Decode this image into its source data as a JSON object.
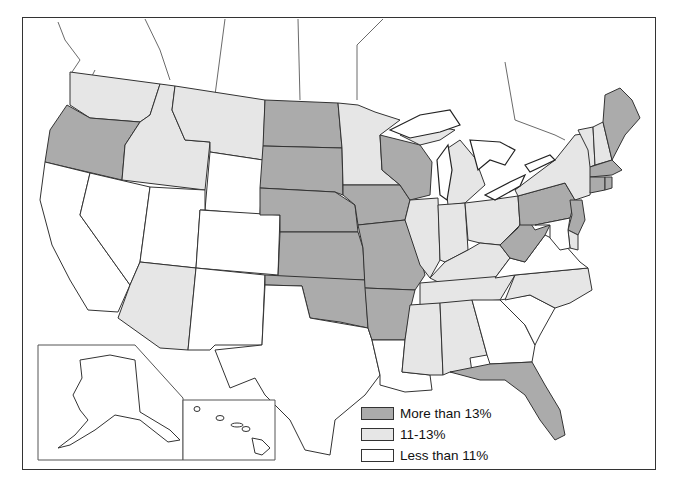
{
  "map": {
    "type": "choropleth",
    "region": "United States",
    "colors": {
      "high": "#ababab",
      "mid": "#e6e6e6",
      "low": "#ffffff",
      "border": "#333333"
    }
  },
  "legend": {
    "items": [
      {
        "key": "high",
        "label": "More than 13%",
        "color": "#ababab"
      },
      {
        "key": "mid",
        "label": "11-13%",
        "color": "#e6e6e6"
      },
      {
        "key": "low",
        "label": "Less than 11%",
        "color": "#ffffff"
      }
    ]
  },
  "states": {
    "high": [
      "OR",
      "ND",
      "SD",
      "NE",
      "KS",
      "OK",
      "IA",
      "MO",
      "AR",
      "WI",
      "PA",
      "NJ",
      "WV",
      "MA",
      "CT",
      "RI",
      "ME",
      "FL"
    ],
    "mid": [
      "WA",
      "ID",
      "MT",
      "AZ",
      "MN",
      "IL",
      "IN",
      "OH",
      "MI",
      "KY",
      "TN",
      "MS",
      "AL",
      "NC",
      "NY",
      "VT",
      "NH",
      "DE"
    ],
    "low": [
      "CA",
      "NV",
      "UT",
      "WY",
      "CO",
      "NM",
      "TX",
      "LA",
      "GA",
      "SC",
      "VA",
      "MD",
      "AK",
      "HI"
    ]
  },
  "insets": [
    "Alaska",
    "Hawaii"
  ]
}
